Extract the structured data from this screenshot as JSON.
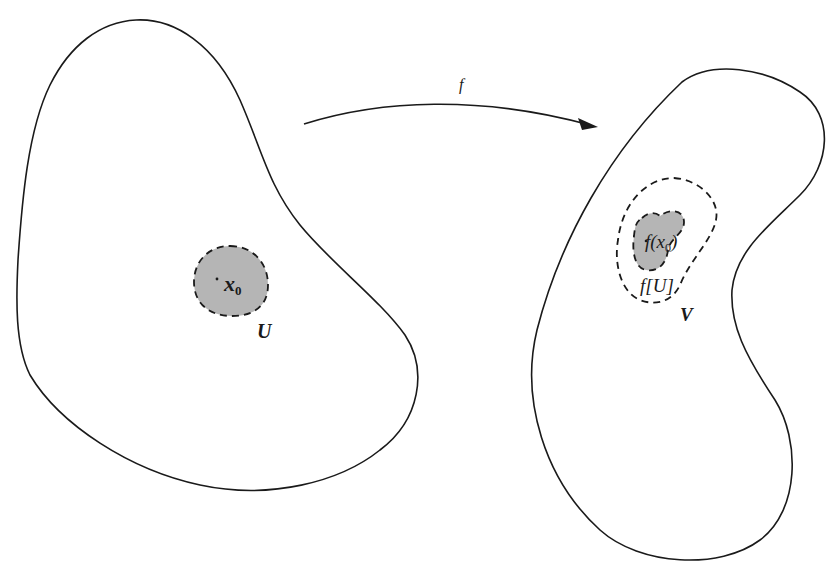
{
  "diagram": {
    "colors": {
      "stroke": "#1a1a1a",
      "shade": "#b5b5b5",
      "background": "#ffffff"
    },
    "left_region": {
      "point_label": "x",
      "point_subscript": "0",
      "neighbourhood_label": "U"
    },
    "arrow": {
      "label": "f"
    },
    "right_region": {
      "image_point_label_prefix": "f(x",
      "image_point_subscript": "0",
      "image_point_label_suffix": ")",
      "image_set_label": "f[U]",
      "neighbourhood_label": "V"
    }
  }
}
